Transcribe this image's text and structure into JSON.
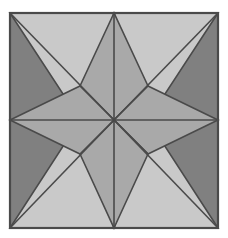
{
  "artwork": {
    "title": "Eight-Pointed Star Tile",
    "type": "geometric-figure",
    "canvas": {
      "width": 228,
      "height": 238,
      "background_color": "#ffffff"
    },
    "frame": {
      "x": 10,
      "y": 13,
      "width": 208,
      "height": 215,
      "stroke_color": "#4a4a4a",
      "stroke_width": 2
    },
    "palette": {
      "background_gray": "#808080",
      "mid_gray": "#a9a9a9",
      "light_gray": "#c9c9c9",
      "outline": "#4a4a4a"
    },
    "geometry": {
      "center_x": 114,
      "center_y": 120,
      "left": 10,
      "right": 218,
      "top": 13,
      "bottom": 228,
      "mid_x": 114,
      "mid_y": 120,
      "inner_offset": 34,
      "point_count": 8,
      "edge_points": 4,
      "corner_points": 4,
      "symmetry": "4-fold rotational"
    },
    "shapes": [
      {
        "name": "background-square",
        "fill": "#808080"
      },
      {
        "name": "corner-ray-top-left",
        "fill": "#c9c9c9"
      },
      {
        "name": "corner-ray-top-right",
        "fill": "#c9c9c9"
      },
      {
        "name": "corner-ray-bottom-right",
        "fill": "#c9c9c9"
      },
      {
        "name": "corner-ray-bottom-left",
        "fill": "#c9c9c9"
      },
      {
        "name": "star-point-top",
        "fill": "#a9a9a9"
      },
      {
        "name": "star-point-right",
        "fill": "#a9a9a9"
      },
      {
        "name": "star-point-bottom",
        "fill": "#a9a9a9"
      },
      {
        "name": "star-point-left",
        "fill": "#a9a9a9"
      }
    ]
  }
}
